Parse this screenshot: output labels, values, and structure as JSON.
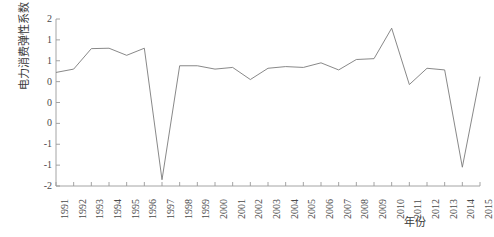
{
  "chart_data": {
    "type": "line",
    "title": "",
    "xlabel": "年份",
    "ylabel": "电力消费弹性系数",
    "xlim": [
      1991,
      2015
    ],
    "ylim": [
      -2,
      2
    ],
    "grid": false,
    "legend": false,
    "legend_position": "none",
    "line_color": "#7a7a7a",
    "axis_color": "#9a9a9a",
    "categories": [
      "1991",
      "1992",
      "1993",
      "1994",
      "1995",
      "1996",
      "1997",
      "1998",
      "1999",
      "2000",
      "2001",
      "2002",
      "2003",
      "2004",
      "2005",
      "2006",
      "2007",
      "2008",
      "2009",
      "2010",
      "2011",
      "2012",
      "2013",
      "2014",
      "2015"
    ],
    "values": [
      0.72,
      0.8,
      1.29,
      1.3,
      1.13,
      1.3,
      -1.85,
      0.88,
      0.88,
      0.8,
      0.84,
      0.55,
      0.82,
      0.86,
      0.84,
      0.95,
      0.78,
      1.03,
      1.05,
      1.78,
      0.43,
      0.82,
      0.78,
      -1.55,
      0.62
    ],
    "ytick_values": [
      2,
      1.5,
      1,
      0.5,
      0,
      -0.5,
      -1,
      -1.5,
      -2
    ],
    "ytick_labels": [
      "2",
      "1",
      "1",
      "0",
      "0",
      "0",
      "-1",
      "-1",
      "-2"
    ]
  }
}
